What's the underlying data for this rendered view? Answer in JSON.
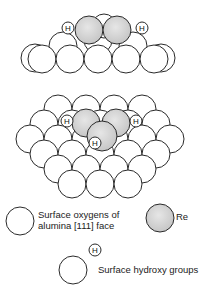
{
  "colors": {
    "re_fill": "#d4d4d4",
    "outline": "#2a2a2a",
    "background": "#ffffff"
  },
  "atoms": {
    "hydrogen_label": "H"
  },
  "legend": {
    "oxygen_line1": "Surface oxygens of",
    "oxygen_line2": "alumina [111] face",
    "re": "Re",
    "hydroxy": "Surface hydroxy groups"
  }
}
